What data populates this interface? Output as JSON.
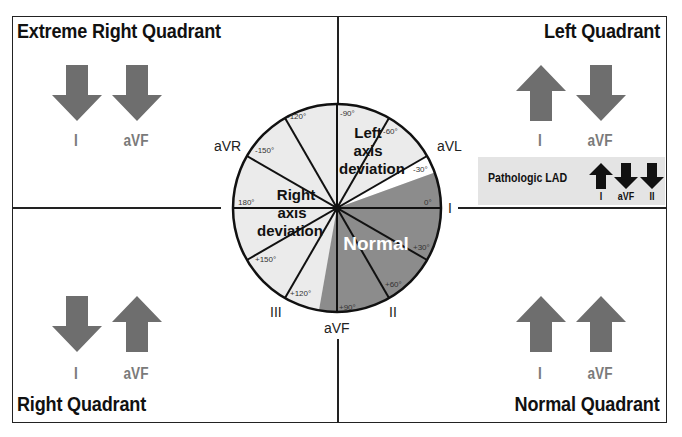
{
  "diagram": {
    "colors": {
      "border": "#222222",
      "arrow": "#6e6e6e",
      "lead_label": "#7a7a7a",
      "sector_light": "#ebebeb",
      "sector_normal": "#8c8c8c",
      "sector_white": "#ffffff",
      "lad_box": "#e4e4e4",
      "lad_arrow": "#111111"
    },
    "quadrants": [
      {
        "id": "extreme-right",
        "title": "Extreme Right Quadrant",
        "position": "top-left",
        "leads": [
          {
            "label": "I",
            "direction": "down"
          },
          {
            "label": "aVF",
            "direction": "down"
          }
        ]
      },
      {
        "id": "left",
        "title": "Left Quadrant",
        "position": "top-right",
        "leads": [
          {
            "label": "I",
            "direction": "up"
          },
          {
            "label": "aVF",
            "direction": "down"
          }
        ]
      },
      {
        "id": "right",
        "title": "Right Quadrant",
        "position": "bottom-left",
        "leads": [
          {
            "label": "I",
            "direction": "down"
          },
          {
            "label": "aVF",
            "direction": "up"
          }
        ]
      },
      {
        "id": "normal",
        "title": "Normal Quadrant",
        "position": "bottom-right",
        "leads": [
          {
            "label": "I",
            "direction": "up"
          },
          {
            "label": "aVF",
            "direction": "up"
          }
        ]
      }
    ],
    "pathologic_lad": {
      "title": "Pathologic LAD",
      "leads": [
        {
          "label": "I",
          "direction": "up"
        },
        {
          "label": "aVF",
          "direction": "down"
        },
        {
          "label": "II",
          "direction": "down"
        }
      ]
    },
    "axis_wheel": {
      "center": [
        337,
        208
      ],
      "radius": 104,
      "sectors": [
        {
          "name": "Left axis deviation",
          "from_deg": -90,
          "to_deg": -30,
          "fill": "light"
        },
        {
          "name": "Borderline",
          "from_deg": -30,
          "to_deg": -20,
          "fill": "white"
        },
        {
          "name": "Normal",
          "from_deg": -20,
          "to_deg": 100,
          "fill": "normal"
        },
        {
          "name": "Right axis deviation",
          "from_deg": 100,
          "to_deg": 270,
          "fill": "light"
        }
      ],
      "region_labels": {
        "left_axis": [
          "Left",
          "axis",
          "deviation"
        ],
        "right_axis": [
          "Right",
          "axis",
          "deviation"
        ],
        "normal": "Normal"
      },
      "degree_ticks": [
        {
          "deg": -90,
          "label": "-90°"
        },
        {
          "deg": -60,
          "label": "-60°"
        },
        {
          "deg": -30,
          "label": "-30°"
        },
        {
          "deg": 0,
          "label": "0°"
        },
        {
          "deg": 30,
          "label": "+30°"
        },
        {
          "deg": 60,
          "label": "+60°"
        },
        {
          "deg": 90,
          "label": "+90°"
        },
        {
          "deg": 120,
          "label": "+120°"
        },
        {
          "deg": 150,
          "label": "+150°"
        },
        {
          "deg": 180,
          "label": "180°"
        },
        {
          "deg": -150,
          "label": "-150°"
        },
        {
          "deg": -120,
          "label": "-120°"
        }
      ],
      "lead_labels": {
        "aVR": "aVR",
        "aVL": "aVL",
        "I": "I",
        "II": "II",
        "III": "III",
        "aVF": "aVF"
      }
    }
  }
}
